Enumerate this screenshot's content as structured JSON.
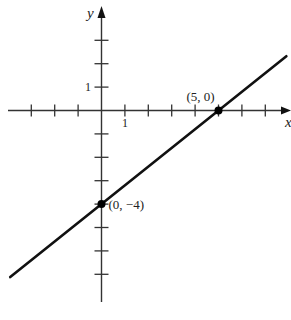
{
  "chart_data": {
    "type": "line",
    "title": "",
    "xlabel": "x",
    "ylabel": "y",
    "xlim": [
      -4,
      8
    ],
    "ylim": [
      -8,
      4
    ],
    "grid": false,
    "x_ticks": [
      -3,
      -2,
      -1,
      1,
      2,
      3,
      4,
      5,
      6,
      7
    ],
    "y_ticks": [
      3,
      2,
      1,
      -1,
      -2,
      -3,
      -4,
      -5,
      -6,
      -7
    ],
    "x_tick_label": "1",
    "y_tick_label": "1",
    "series": [
      {
        "name": "line",
        "equation": "y = (4/5)x - 4",
        "x": [
          -3.9,
          7.9
        ],
        "y": [
          -7.12,
          2.32
        ]
      }
    ],
    "points": [
      {
        "x": 5,
        "y": 0,
        "label": "(5, 0)"
      },
      {
        "x": 0,
        "y": -4,
        "label": "(0, −4)"
      }
    ],
    "colors": {
      "axis": "#333333",
      "line": "#111111",
      "point": "#000000"
    }
  }
}
